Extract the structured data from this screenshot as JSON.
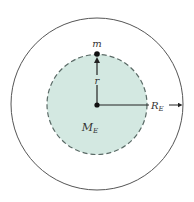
{
  "diagram": {
    "colors": {
      "background": "#ffffff",
      "outer_circle_stroke": "#555555",
      "inner_fill": "#d3e8e1",
      "inner_stroke": "#5a6a66",
      "line": "#222222"
    },
    "outer_circle": {
      "cx": 97,
      "cy": 104,
      "r": 86,
      "label": "Earth surface"
    },
    "inner_sphere": {
      "cx": 97,
      "cy": 104.5,
      "r": 50,
      "style": "dashed",
      "mass_label": "M",
      "mass_subscript": "E"
    },
    "point_mass": {
      "label": "m",
      "x": 97,
      "y": 54
    },
    "radius_r": {
      "label": "r"
    },
    "radius_RE": {
      "label": "R",
      "subscript": "E"
    }
  }
}
